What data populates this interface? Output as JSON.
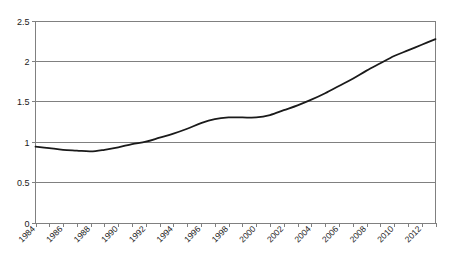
{
  "chart_data": {
    "type": "line",
    "title": "",
    "subtitle": "",
    "xlabel": "",
    "ylabel": "",
    "xlim": [
      1984,
      2013
    ],
    "ylim": [
      0,
      2.5
    ],
    "grid": true,
    "legend": false,
    "legend_position": "none",
    "y_ticks": [
      "0",
      "0.5",
      "1",
      "1.5",
      "2",
      "2.5"
    ],
    "y_tick_values": [
      0,
      0.5,
      1,
      1.5,
      2,
      2.5
    ],
    "x_tick_values": [
      1984,
      1985,
      1986,
      1987,
      1988,
      1989,
      1990,
      1991,
      1992,
      1993,
      1994,
      1995,
      1996,
      1997,
      1998,
      1999,
      2000,
      2001,
      2002,
      2003,
      2004,
      2005,
      2006,
      2007,
      2008,
      2009,
      2010,
      2011,
      2012,
      2013
    ],
    "x_tick_labels": [
      "1984",
      "",
      "1986",
      "",
      "1988",
      "",
      "1990",
      "",
      "1992",
      "",
      "1994",
      "",
      "1996",
      "",
      "1998",
      "",
      "2000",
      "",
      "2002",
      "",
      "2004",
      "",
      "2006",
      "",
      "2008",
      "",
      "2010",
      "",
      "2012",
      ""
    ],
    "x_label_rotation_deg": -45,
    "series": [
      {
        "name": "series-1",
        "color": "#1a1a1a",
        "x": [
          1984,
          1985,
          1986,
          1987,
          1988,
          1989,
          1990,
          1991,
          1992,
          1993,
          1994,
          1995,
          1996,
          1997,
          1998,
          1999,
          2000,
          2001,
          2002,
          2003,
          2004,
          2005,
          2006,
          2007,
          2008,
          2009,
          2010,
          2011,
          2012,
          2013
        ],
        "values": [
          0.94,
          0.92,
          0.9,
          0.89,
          0.88,
          0.9,
          0.93,
          0.97,
          1.0,
          1.05,
          1.1,
          1.16,
          1.23,
          1.28,
          1.3,
          1.3,
          1.3,
          1.33,
          1.39,
          1.45,
          1.52,
          1.6,
          1.69,
          1.78,
          1.88,
          1.97,
          2.06,
          2.13,
          2.2,
          2.27
        ]
      }
    ]
  },
  "colors": {
    "line": "#1a1a1a",
    "grid": "#808080",
    "axis": "#808080",
    "text": "#1a1a1a",
    "background": "#ffffff"
  }
}
